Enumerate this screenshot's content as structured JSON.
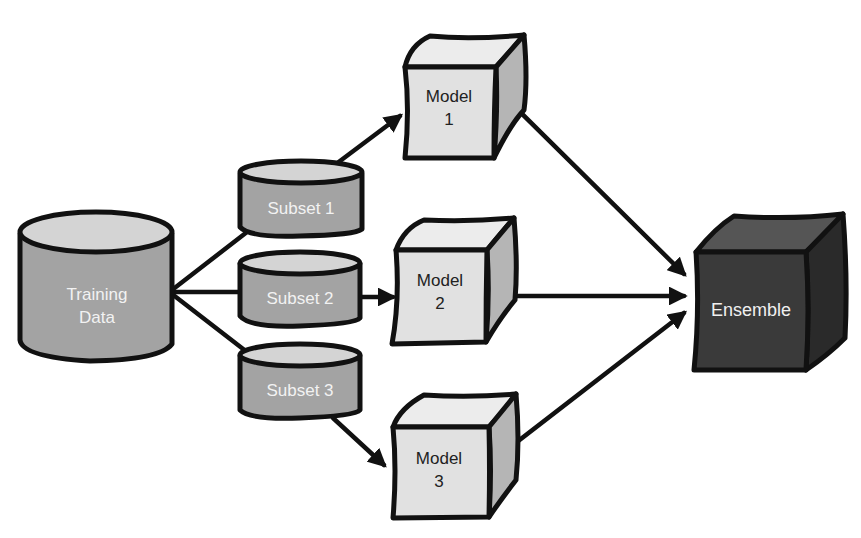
{
  "diagram": {
    "type": "ensemble-learning-flow",
    "colors": {
      "cylinder_body": "#a3a3a3",
      "cylinder_top": "#d4d4d4",
      "model_front": "#e1e1e1",
      "model_top": "#ececec",
      "model_side": "#b5b5b5",
      "ensemble_front": "#3a3a3a",
      "ensemble_top": "#555555",
      "ensemble_side": "#2a2a2a",
      "outline": "#111111"
    },
    "nodes": {
      "training_data": {
        "line1": "Training",
        "line2": "Data"
      },
      "subset1": {
        "label": "Subset 1"
      },
      "subset2": {
        "label": "Subset 2"
      },
      "subset3": {
        "label": "Subset 3"
      },
      "model1": {
        "line1": "Model",
        "line2": "1"
      },
      "model2": {
        "line1": "Model",
        "line2": "2"
      },
      "model3": {
        "line1": "Model",
        "line2": "3"
      },
      "ensemble": {
        "label": "Ensemble"
      }
    },
    "edges": [
      {
        "from": "Training Data",
        "to": "Subset 1"
      },
      {
        "from": "Training Data",
        "to": "Subset 2"
      },
      {
        "from": "Training Data",
        "to": "Subset 3"
      },
      {
        "from": "Subset 1",
        "to": "Model 1",
        "arrow": true
      },
      {
        "from": "Subset 2",
        "to": "Model 2",
        "arrow": true
      },
      {
        "from": "Subset 3",
        "to": "Model 3",
        "arrow": true
      },
      {
        "from": "Model 1",
        "to": "Ensemble",
        "arrow": true
      },
      {
        "from": "Model 2",
        "to": "Ensemble",
        "arrow": true
      },
      {
        "from": "Model 3",
        "to": "Ensemble",
        "arrow": true
      }
    ]
  }
}
